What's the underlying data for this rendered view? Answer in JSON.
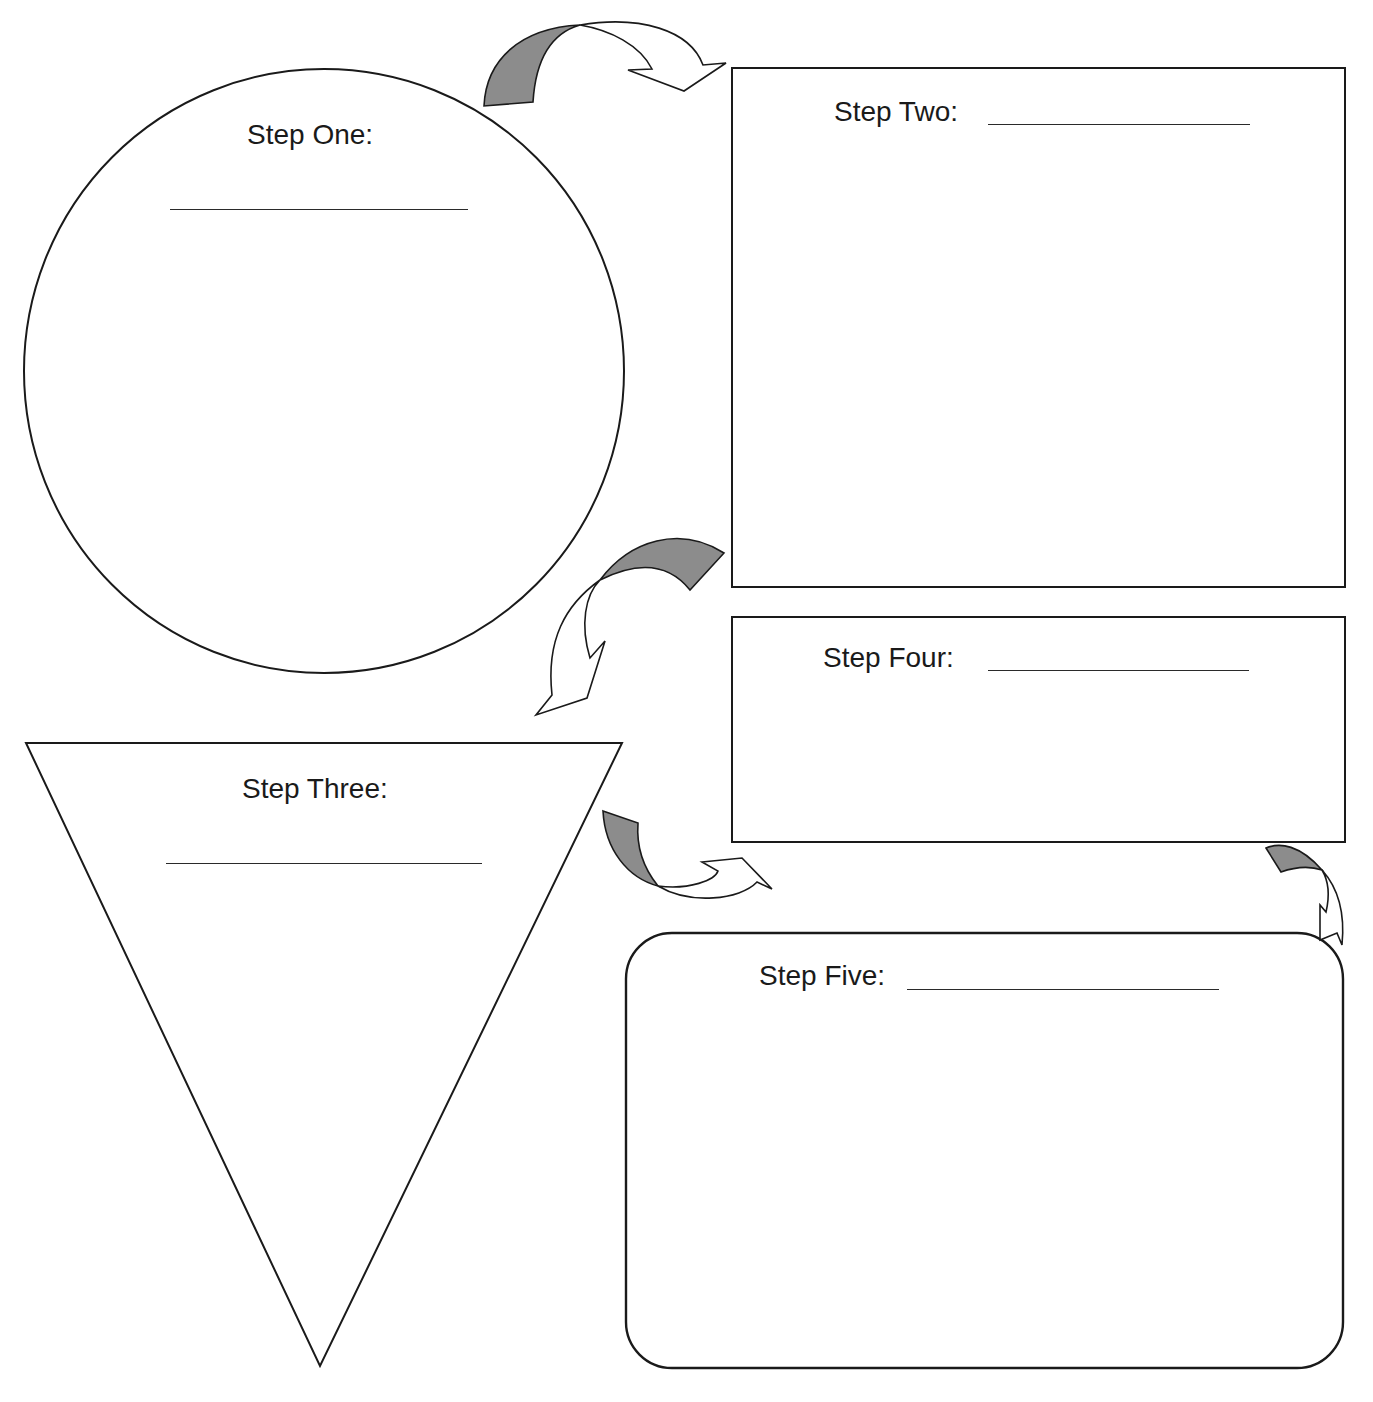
{
  "page": {
    "header_cut_text": "Sequence Chart — Organizing steps"
  },
  "steps": [
    {
      "id": 1,
      "label": "Step One:",
      "shape": "circle",
      "blank": ""
    },
    {
      "id": 2,
      "label": "Step Two:",
      "shape": "rectangle",
      "blank": ""
    },
    {
      "id": 3,
      "label": "Step Three:",
      "shape": "inverted-triangle",
      "blank": ""
    },
    {
      "id": 4,
      "label": "Step Four:",
      "shape": "rectangle",
      "blank": ""
    },
    {
      "id": 5,
      "label": "Step Five:",
      "shape": "rounded-rectangle",
      "blank": ""
    }
  ],
  "arrows": [
    {
      "from": 1,
      "to": 2,
      "icon": "curved-arrow-icon"
    },
    {
      "from": 2,
      "to": 3,
      "icon": "curved-arrow-icon"
    },
    {
      "from": 3,
      "to": 4,
      "icon": "curved-arrow-icon"
    },
    {
      "from": 4,
      "to": 5,
      "icon": "curved-arrow-icon"
    }
  ],
  "colors": {
    "stroke": "#1a1a1a",
    "arrow_shade": "#8c8c8c",
    "background": "#ffffff"
  }
}
